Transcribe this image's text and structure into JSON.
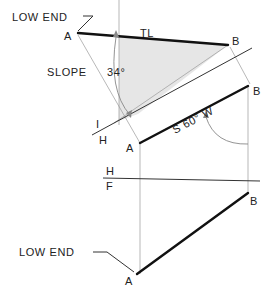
{
  "diagram": {
    "type": "descriptive-geometry-slope-of-line",
    "labels": {
      "low_end_top": "LOW END",
      "low_end_bottom": "LOW END",
      "point_a_aux": "A",
      "point_b_aux": "B",
      "true_length": "TL",
      "slope": "SLOPE",
      "slope_angle": "34°",
      "fold_line_1_upper": "I",
      "fold_line_1_lower": "H",
      "point_a_horizontal": "A",
      "point_b_horizontal": "B",
      "bearing": "S 60° W",
      "fold_line_2_upper": "H",
      "fold_line_2_lower": "F",
      "point_a_front": "A",
      "point_b_front": "B"
    },
    "colors": {
      "line_primary": "#111111",
      "line_construction": "#9a9a9a",
      "shading": "#e6e6e6",
      "text": "#222222"
    }
  }
}
